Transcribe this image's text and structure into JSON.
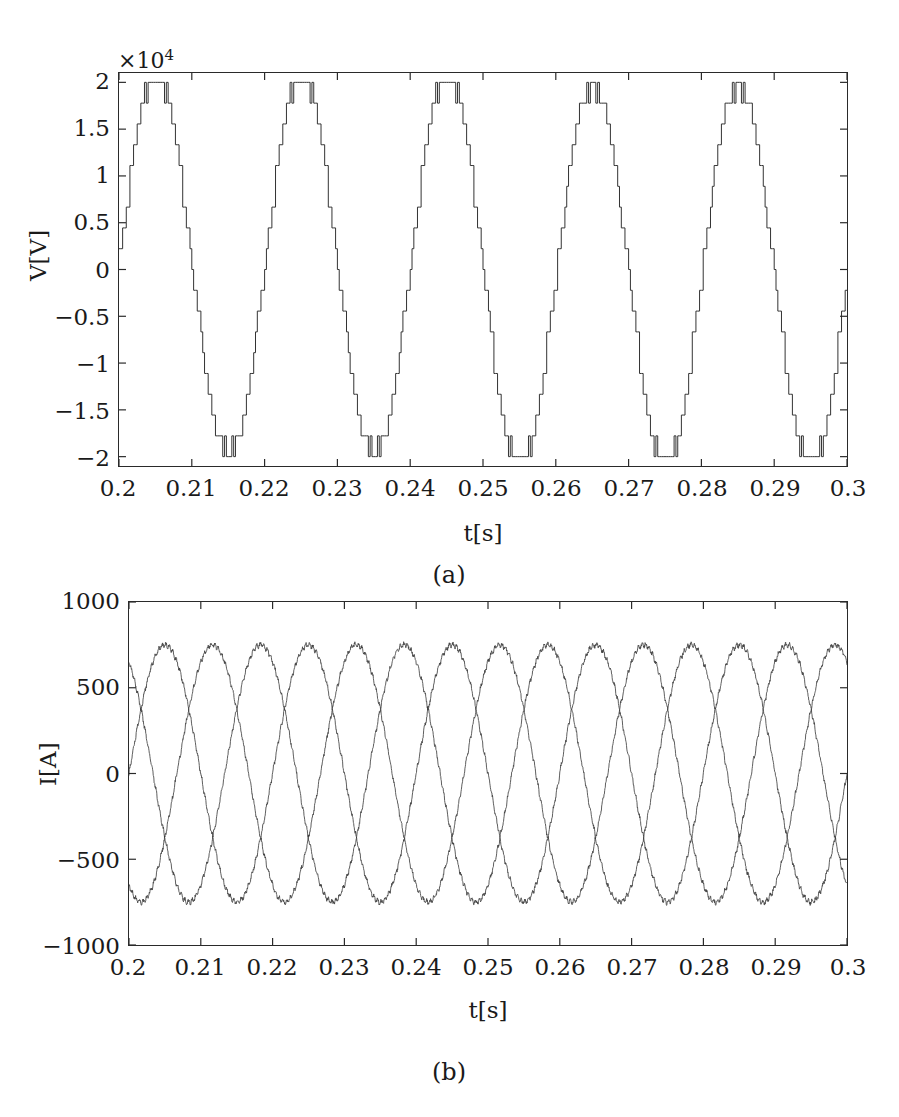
{
  "figure": {
    "background_color": "#ffffff",
    "trace_color": "#333333",
    "axis_color": "#2a2a2a"
  },
  "panels": [
    {
      "id": "panel-a",
      "caption": "(a)",
      "exponent_label": "×10",
      "exponent_power": "4",
      "xlabel": "t[s]",
      "ylabel": "V[V]",
      "xticks": [
        "0.2",
        "0.21",
        "0.22",
        "0.23",
        "0.24",
        "0.25",
        "0.26",
        "0.27",
        "0.28",
        "0.29",
        "0.3"
      ],
      "xtick_values": [
        0.2,
        0.21,
        0.22,
        0.23,
        0.24,
        0.25,
        0.26,
        0.27,
        0.28,
        0.29,
        0.3
      ],
      "yticks": [
        "2",
        "1.5",
        "1",
        "0.5",
        "0",
        "−0.5",
        "−1",
        "−1.5",
        "−2"
      ],
      "ytick_values": [
        2,
        1.5,
        1,
        0.5,
        0,
        -0.5,
        -1,
        -1.5,
        -2
      ]
    },
    {
      "id": "panel-b",
      "caption": "(b)",
      "xlabel": "t[s]",
      "ylabel": "I[A]",
      "xticks": [
        "0.2",
        "0.21",
        "0.22",
        "0.23",
        "0.24",
        "0.25",
        "0.26",
        "0.27",
        "0.28",
        "0.29",
        "0.3"
      ],
      "xtick_values": [
        0.2,
        0.21,
        0.22,
        0.23,
        0.24,
        0.25,
        0.26,
        0.27,
        0.28,
        0.29,
        0.3
      ],
      "yticks": [
        "1000",
        "500",
        "0",
        "−500",
        "−1000"
      ],
      "ytick_values": [
        1000,
        500,
        0,
        -500,
        -1000
      ]
    }
  ],
  "chart_data": [
    {
      "type": "line",
      "id": "voltage-waveform",
      "title": "",
      "xlabel": "t[s]",
      "ylabel": "V[V]",
      "y_exponent": 4,
      "xlim": [
        0.2,
        0.3
      ],
      "ylim": [
        -2.1,
        2.1
      ],
      "y_display_scale": 10000,
      "grid": false,
      "legend": "none",
      "waveform": "multilevel-staircase-pwm",
      "levels": 19,
      "level_count_per_half_cycle": 9,
      "fundamental_frequency_hz": 50,
      "period_s": 0.02,
      "cycles_shown": 5,
      "amplitude": 2.0,
      "amplitude_volts": 20000,
      "pwm_carrier_frequency_hz": 2000,
      "step_values": [
        -2,
        -1.75,
        -1.5,
        -1.25,
        -1,
        -0.75,
        -0.5,
        -0.25,
        0,
        0.25,
        0.5,
        0.75,
        1,
        1.25,
        1.5,
        1.75,
        2
      ],
      "series": [
        {
          "name": "V_out",
          "phase_deg": 0,
          "amplitude": 2.0
        }
      ],
      "notes": "Staircase output voltage of multilevel inverter with high-frequency PWM chopping at each level transition."
    },
    {
      "type": "line",
      "id": "current-waveform",
      "title": "",
      "xlabel": "t[s]",
      "ylabel": "I[A]",
      "xlim": [
        0.2,
        0.3
      ],
      "ylim": [
        -1000,
        1000
      ],
      "grid": false,
      "legend": "none",
      "waveform": "three-phase-sinusoidal-with-ripple",
      "fundamental_frequency_hz": 50,
      "period_s": 0.02,
      "cycles_shown": 5,
      "amplitude": 750,
      "ripple_amplitude": 18,
      "ripple_frequency_hz": 2000,
      "series": [
        {
          "name": "I_a",
          "phase_deg": 0,
          "amplitude": 750
        },
        {
          "name": "I_b",
          "phase_deg": -120,
          "amplitude": 750
        },
        {
          "name": "I_c",
          "phase_deg": 120,
          "amplitude": 750
        }
      ],
      "notes": "Three-phase load currents, balanced, 120 degree phase displacement, small switching ripple superimposed."
    }
  ]
}
